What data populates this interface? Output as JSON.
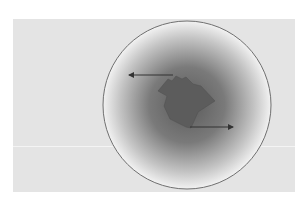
{
  "diagram": {
    "background_color": "#ffffff",
    "panel_color": "#e4e4e4",
    "divider_color": "#f4f4f4",
    "sphere": {
      "cx": 187,
      "cy": 105,
      "r": 84,
      "outline_color": "#6f6f6f",
      "center_color": "#5a5a5a",
      "edge_color": "#f2f2f2"
    },
    "blob": {
      "fill": "#5c5c5c",
      "points": "158,91 168,79 172,81 176,76 182,79 186,77 193,84 201,86 215,101 198,112 191,128 186,127 170,119 164,106 167,96"
    },
    "arrows": [
      {
        "name": "left-arrow",
        "x1": 173,
        "y1": 75,
        "x2": 129,
        "y2": 75,
        "color": "#333333"
      },
      {
        "name": "right-arrow",
        "x1": 190,
        "y1": 127,
        "x2": 233,
        "y2": 127,
        "color": "#333333"
      }
    ]
  }
}
